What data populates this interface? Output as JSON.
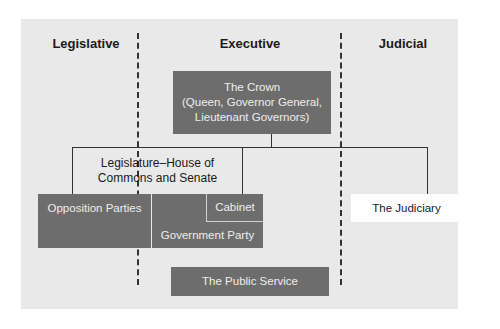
{
  "diagram": {
    "headers": {
      "legislative": "Legislative",
      "executive": "Executive",
      "judicial": "Judicial"
    },
    "crown": {
      "title": "The Crown",
      "line1": "(Queen, Governor General,",
      "line2": "Lieutenant Governors)"
    },
    "legislature": {
      "line1": "Legislature–House of",
      "line2": "Commons and Senate"
    },
    "opposition": "Opposition Parties",
    "cabinet": "Cabinet",
    "government_party": "Government Party",
    "judiciary": "The Judiciary",
    "public_service": "The Public Service",
    "colors": {
      "panel_bg": "#e9e9e9",
      "dark_box": "#6d6d6d",
      "light_text": "#eeeeee",
      "judiciary_bg": "#ffffff",
      "line": "#333333"
    }
  }
}
